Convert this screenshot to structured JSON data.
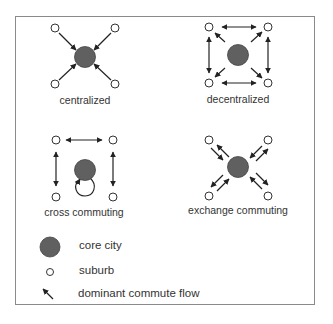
{
  "panels": [
    {
      "id": "centralized",
      "label": "centralized"
    },
    {
      "id": "decentralized",
      "label": "decentralized"
    },
    {
      "id": "cross-commuting",
      "label": "cross commuting"
    },
    {
      "id": "exchange-commuting",
      "label": "exchange commuting"
    }
  ],
  "legend": {
    "core_city": "core city",
    "suburb": "suburb",
    "flow": "dominant commute flow"
  },
  "colors": {
    "core_fill": "#606060",
    "border": "#8a8a8a",
    "line": "#222222"
  }
}
